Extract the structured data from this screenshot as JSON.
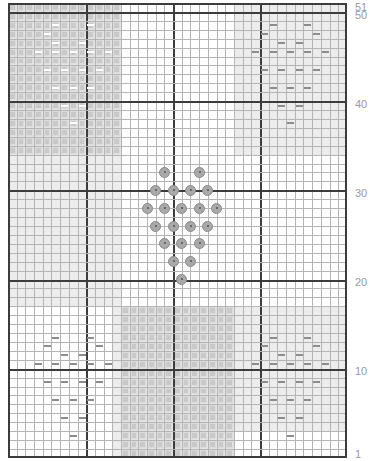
{
  "pattern": {
    "title": "Cross-stitch heart chart",
    "columns": 39,
    "rows": 51,
    "major_every": 10,
    "cell_w": 8.69,
    "cell_h": 8.92,
    "colors": {
      "grid_minor": "#b4b4b4",
      "grid_major": "#3c3c3c",
      "stitch_fill": "#c9c9c9",
      "light_wash": "#ececec",
      "dash": "#8c8c8c",
      "bead": "#a9a9a9",
      "label": "#999999"
    }
  },
  "row_labels": [
    {
      "text": "51",
      "y": 2
    },
    {
      "text": "50",
      "y": 10
    },
    {
      "text": "40",
      "y": 99
    },
    {
      "text": "30",
      "y": 188
    },
    {
      "text": "20",
      "y": 277
    },
    {
      "text": "10",
      "y": 366
    },
    {
      "text": "1",
      "y": 449
    }
  ],
  "regions": [
    {
      "name": "top-left-stitched-block",
      "col": 0,
      "row": 0,
      "w": 13,
      "h": 17,
      "type": "stitched"
    },
    {
      "name": "left-light-wash",
      "col": 0,
      "row": 17,
      "w": 13,
      "h": 17,
      "type": "wash"
    },
    {
      "name": "top-right-wash",
      "col": 26,
      "row": 0,
      "w": 13,
      "h": 17,
      "type": "wash"
    },
    {
      "name": "bottom-center-stitched-block",
      "col": 13,
      "row": 34,
      "w": 13,
      "h": 17,
      "type": "stitched"
    },
    {
      "name": "bottom-right-wash",
      "col": 26,
      "row": 34,
      "w": 13,
      "h": 14,
      "type": "wash"
    },
    {
      "name": "bottom-left-sliver",
      "col": 12,
      "row": 34,
      "w": 1,
      "h": 17,
      "type": "wash"
    }
  ],
  "dashes": {
    "top_left": [
      [
        5,
        2
      ],
      [
        9,
        2
      ],
      [
        4,
        3
      ],
      [
        5,
        4
      ],
      [
        8,
        4
      ],
      [
        3,
        5
      ],
      [
        5,
        5
      ],
      [
        7,
        5
      ],
      [
        9,
        5
      ],
      [
        11,
        5
      ],
      [
        4,
        7
      ],
      [
        6,
        7
      ],
      [
        8,
        7
      ],
      [
        10,
        7
      ],
      [
        5,
        9
      ],
      [
        7,
        9
      ],
      [
        9,
        9
      ],
      [
        6,
        11
      ],
      [
        8,
        11
      ],
      [
        7,
        13
      ]
    ],
    "top_right": [
      [
        30,
        2
      ],
      [
        34,
        2
      ],
      [
        29,
        3
      ],
      [
        35,
        3
      ],
      [
        31,
        4
      ],
      [
        33,
        4
      ],
      [
        28,
        5
      ],
      [
        30,
        5
      ],
      [
        32,
        5
      ],
      [
        34,
        5
      ],
      [
        36,
        5
      ],
      [
        29,
        7
      ],
      [
        31,
        7
      ],
      [
        33,
        7
      ],
      [
        35,
        7
      ],
      [
        30,
        9
      ],
      [
        32,
        9
      ],
      [
        34,
        9
      ],
      [
        31,
        11
      ],
      [
        33,
        11
      ],
      [
        32,
        13
      ]
    ],
    "bottom_left": [
      [
        5,
        37
      ],
      [
        9,
        37
      ],
      [
        4,
        38
      ],
      [
        10,
        38
      ],
      [
        6,
        39
      ],
      [
        8,
        39
      ],
      [
        3,
        40
      ],
      [
        5,
        40
      ],
      [
        7,
        40
      ],
      [
        9,
        40
      ],
      [
        11,
        40
      ],
      [
        4,
        42
      ],
      [
        6,
        42
      ],
      [
        8,
        42
      ],
      [
        10,
        42
      ],
      [
        5,
        44
      ],
      [
        7,
        44
      ],
      [
        9,
        44
      ],
      [
        6,
        46
      ],
      [
        8,
        46
      ],
      [
        7,
        48
      ]
    ],
    "bottom_right": [
      [
        30,
        37
      ],
      [
        34,
        37
      ],
      [
        29,
        38
      ],
      [
        35,
        38
      ],
      [
        31,
        39
      ],
      [
        33,
        39
      ],
      [
        28,
        40
      ],
      [
        30,
        40
      ],
      [
        32,
        40
      ],
      [
        34,
        40
      ],
      [
        36,
        40
      ],
      [
        29,
        42
      ],
      [
        31,
        42
      ],
      [
        33,
        42
      ],
      [
        35,
        42
      ],
      [
        30,
        44
      ],
      [
        32,
        44
      ],
      [
        34,
        44
      ],
      [
        31,
        46
      ],
      [
        33,
        46
      ],
      [
        32,
        48
      ]
    ]
  },
  "beads": [
    [
      17,
      18
    ],
    [
      21,
      18
    ],
    [
      16,
      20
    ],
    [
      18,
      20
    ],
    [
      20,
      20
    ],
    [
      22,
      20
    ],
    [
      15,
      22
    ],
    [
      17,
      22
    ],
    [
      19,
      22
    ],
    [
      21,
      22
    ],
    [
      23,
      22
    ],
    [
      16,
      24
    ],
    [
      18,
      24
    ],
    [
      20,
      24
    ],
    [
      22,
      24
    ],
    [
      17,
      26
    ],
    [
      19,
      26
    ],
    [
      21,
      26
    ],
    [
      18,
      28
    ],
    [
      20,
      28
    ],
    [
      19,
      30
    ]
  ]
}
